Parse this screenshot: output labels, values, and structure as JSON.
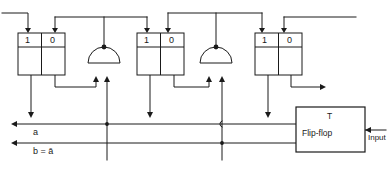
{
  "diagram": {
    "stroke_color": "#1a1a1a",
    "background": "#ffffff",
    "cells": [
      {
        "id": "stage-1",
        "left_label": "1",
        "right_label": "0",
        "x": 18,
        "y": 33,
        "w": 47,
        "h": 42
      },
      {
        "id": "stage-2",
        "left_label": "1",
        "right_label": "0",
        "x": 137,
        "y": 33,
        "w": 47,
        "h": 42
      },
      {
        "id": "stage-3",
        "left_label": "1",
        "right_label": "0",
        "x": 255,
        "y": 33,
        "w": 47,
        "h": 42
      }
    ],
    "gates": [
      {
        "id": "gate-1",
        "type": "dome-and-gate",
        "cx": 104,
        "cy": 63,
        "r": 16
      },
      {
        "id": "gate-2",
        "type": "dome-and-gate",
        "cx": 216,
        "cy": 63,
        "r": 16
      }
    ],
    "buses": [
      {
        "id": "bus-a",
        "label": "a",
        "y": 124,
        "label_x": 33,
        "label_y": 127
      },
      {
        "id": "bus-b",
        "label": "b = ā",
        "y": 143,
        "label_x": 33,
        "label_y": 146
      }
    ],
    "flipflop": {
      "type_label": "T",
      "name_label": "Flip-flop",
      "input_label": "Input",
      "x": 296,
      "y": 107,
      "w": 69,
      "h": 45
    }
  }
}
